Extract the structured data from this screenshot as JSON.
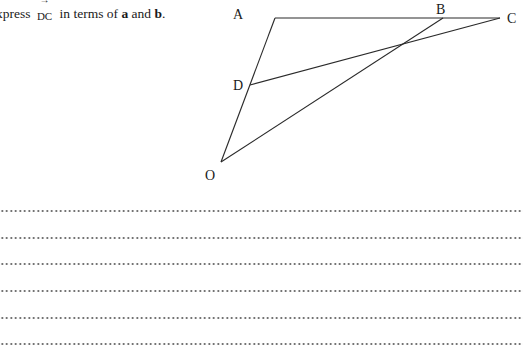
{
  "question": {
    "prefix": "xpress",
    "vector": "DC",
    "vector_arrow": "→",
    "middle": "in terms of",
    "var_a": "a",
    "conjunction": "and",
    "var_b": "b",
    "suffix": "."
  },
  "diagram": {
    "labels": {
      "A": "A",
      "B": "B",
      "C": "C",
      "D": "D",
      "O": "O"
    },
    "points": {
      "A": [
        275,
        18
      ],
      "B": [
        443,
        18
      ],
      "C": [
        500,
        18
      ],
      "D": [
        250,
        85
      ],
      "O": [
        221,
        162
      ]
    },
    "segments": [
      "A-C",
      "A-O",
      "O-B",
      "D-C"
    ]
  },
  "answer_lines": {
    "count": 6,
    "y_positions": [
      211,
      238,
      264,
      291,
      318,
      344
    ]
  }
}
